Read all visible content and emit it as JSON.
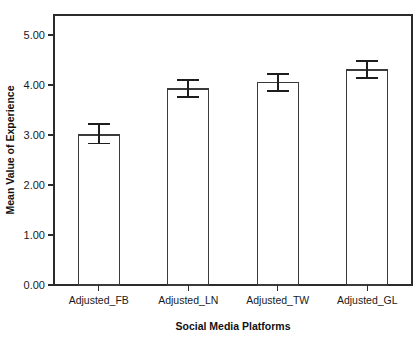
{
  "chart_data": {
    "type": "bar",
    "title": "",
    "xlabel": "Social Media Platforms",
    "ylabel": "Mean Value of Experience",
    "categories": [
      "Adjusted_FB",
      "Adjusted_LN",
      "Adjusted_TW",
      "Adjusted_GL"
    ],
    "values": [
      3.0,
      3.92,
      4.05,
      4.3
    ],
    "error_upper": [
      3.22,
      4.1,
      4.22,
      4.48
    ],
    "error_lower": [
      2.83,
      3.76,
      3.88,
      4.14
    ],
    "ylim": [
      0.0,
      5.5
    ],
    "ytick_values": [
      0.0,
      1.0,
      2.0,
      3.0,
      4.0,
      5.0
    ],
    "ytick_labels": [
      "0.00",
      "1.00",
      "2.00",
      "3.00",
      "4.00",
      "5.00"
    ],
    "grid": false,
    "legend": "none",
    "bar_fill_color": "#ffffff",
    "bar_edge_color": "#3a3a3a",
    "error_bar_color": "#1d1d1d",
    "axis_color": "#2b2b2b",
    "background_color": "#ffffff"
  }
}
